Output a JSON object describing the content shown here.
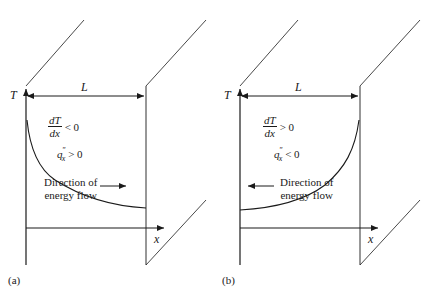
{
  "figure": {
    "panels": [
      {
        "id": "a",
        "tag": "(a)",
        "y_axis_label": "T",
        "x_axis_label": "x",
        "length_label": "L",
        "gradient": {
          "numerator": "dT",
          "denominator": "dx",
          "relation": "< 0"
        },
        "flux": {
          "symbol": "q",
          "superscript": "″",
          "subscript": "x",
          "relation": "> 0"
        },
        "flow_text": {
          "line1": "Direction of",
          "line2": "energy flow"
        },
        "flow_direction": "right",
        "profile": "decreasing"
      },
      {
        "id": "b",
        "tag": "(b)",
        "y_axis_label": "T",
        "x_axis_label": "x",
        "length_label": "L",
        "gradient": {
          "numerator": "dT",
          "denominator": "dx",
          "relation": "> 0"
        },
        "flux": {
          "symbol": "q",
          "superscript": "″",
          "subscript": "x",
          "relation": "< 0"
        },
        "flow_text": {
          "line1": "Direction of",
          "line2": "energy flow"
        },
        "flow_direction": "left",
        "profile": "increasing"
      }
    ],
    "colors": {
      "line": "#1a1a1a",
      "background": "#ffffff"
    }
  }
}
